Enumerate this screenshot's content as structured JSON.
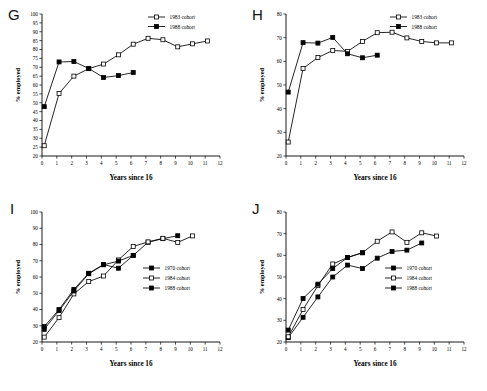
{
  "figure": {
    "axis_x_title": "Years since 16",
    "axis_y_title": "% employed"
  },
  "panels": [
    {
      "letter": "G",
      "chart_data": {
        "type": "line",
        "title": "G",
        "xlabel": "Years since 16",
        "ylabel": "% employed",
        "xlim": [
          0,
          12
        ],
        "ylim": [
          20,
          100
        ],
        "xticks": [
          0,
          1,
          2,
          3,
          4,
          5,
          6,
          7,
          8,
          9,
          10,
          11,
          12
        ],
        "yticks": [
          20,
          25,
          30,
          35,
          40,
          45,
          50,
          55,
          60,
          65,
          70,
          75,
          80,
          85,
          90,
          95,
          100
        ],
        "grid": false,
        "legend_position": "top-right",
        "series": [
          {
            "name": "1983 cohort",
            "marker": "open-square",
            "x": [
              0.15,
              1.15,
              2.15,
              3.15,
              4.15,
              5.15,
              6.15,
              7.15,
              8.15,
              9.15,
              10.15,
              11.15
            ],
            "values": [
              25.8,
              55.2,
              65.0,
              69.2,
              71.8,
              77.0,
              83.0,
              86.3,
              85.5,
              81.5,
              83.2,
              84.8
            ]
          },
          {
            "name": "1988 cohort",
            "marker": "filled-square",
            "x": [
              0.15,
              1.15,
              2.15,
              3.15,
              4.15,
              5.15,
              6.15
            ],
            "values": [
              47.8,
              73.0,
              73.2,
              69.3,
              64.2,
              65.3,
              67.0
            ]
          }
        ]
      }
    },
    {
      "letter": "H",
      "chart_data": {
        "type": "line",
        "title": "H",
        "xlabel": "Years since 16",
        "ylabel": "% employed",
        "xlim": [
          0,
          12
        ],
        "ylim": [
          20,
          80
        ],
        "xticks": [
          0,
          1,
          2,
          3,
          4,
          5,
          6,
          7,
          8,
          9,
          10,
          11,
          12
        ],
        "yticks": [
          20,
          30,
          40,
          50,
          60,
          70,
          80
        ],
        "grid": false,
        "legend_position": "top-right",
        "series": [
          {
            "name": "1983 cohort",
            "marker": "open-square",
            "x": [
              0.15,
              1.15,
              2.15,
              3.15,
              4.15,
              5.15,
              6.15,
              7.15,
              8.15,
              9.15,
              10.15,
              11.15
            ],
            "values": [
              25.9,
              57.0,
              61.6,
              64.6,
              64.2,
              68.4,
              72.1,
              72.3,
              69.9,
              68.4,
              67.8,
              67.8
            ]
          },
          {
            "name": "1988 cohort",
            "marker": "filled-square",
            "x": [
              0.15,
              1.15,
              2.15,
              3.15,
              4.15,
              5.15,
              6.15
            ],
            "values": [
              47.0,
              67.9,
              67.7,
              70.1,
              63.2,
              61.5,
              62.6
            ]
          }
        ]
      }
    },
    {
      "letter": "I",
      "chart_data": {
        "type": "line",
        "title": "I",
        "xlabel": "Years since 16",
        "ylabel": "% employed",
        "xlim": [
          0,
          12
        ],
        "ylim": [
          20,
          100
        ],
        "xticks": [
          0,
          1,
          2,
          3,
          4,
          5,
          6,
          7,
          8,
          9,
          10,
          11,
          12
        ],
        "yticks": [
          20,
          30,
          40,
          50,
          60,
          70,
          80,
          90,
          100
        ],
        "grid": false,
        "legend_position": "right",
        "series": [
          {
            "name": "1970 cohort",
            "marker": "filled-square",
            "x": [
              0.15,
              1.15,
              2.15,
              3.15,
              4.15,
              5.15,
              6.15,
              7.15,
              8.15,
              9.15
            ],
            "values": [
              29.5,
              40.0,
              52.4,
              62.3,
              67.7,
              65.4,
              73.3,
              81.4,
              83.6,
              85.4
            ]
          },
          {
            "name": "1984 cohort",
            "marker": "open-square",
            "x": [
              0.15,
              1.15,
              2.15,
              3.15,
              4.15,
              5.15,
              6.15,
              7.15,
              8.15,
              9.15,
              10.15
            ],
            "values": [
              23.0,
              35.0,
              49.6,
              57.2,
              60.6,
              70.5,
              78.8,
              81.6,
              83.8,
              81.3,
              85.3
            ]
          },
          {
            "name": "1988 cohort",
            "marker": "filled-square",
            "x": [
              0.15,
              1.15,
              2.15,
              3.15,
              4.15,
              5.15,
              6.15
            ],
            "values": [
              27.8,
              39.3,
              51.4,
              62.0,
              67.5,
              69.8,
              73.3
            ]
          }
        ]
      }
    },
    {
      "letter": "J",
      "chart_data": {
        "type": "line",
        "title": "J",
        "xlabel": "Years since 16",
        "ylabel": "% employed",
        "xlim": [
          0,
          12
        ],
        "ylim": [
          20,
          80
        ],
        "xticks": [
          0,
          1,
          2,
          3,
          4,
          5,
          6,
          7,
          8,
          9,
          10,
          11,
          12
        ],
        "yticks": [
          20,
          30,
          40,
          50,
          60,
          70,
          80
        ],
        "grid": false,
        "legend_position": "right",
        "series": [
          {
            "name": "1970 cohort",
            "marker": "filled-square",
            "x": [
              0.15,
              1.15,
              2.15,
              3.15,
              4.15,
              5.15,
              6.15,
              7.15,
              8.15,
              9.15
            ],
            "values": [
              22.0,
              31.4,
              40.8,
              50.0,
              55.5,
              53.9,
              58.7,
              61.8,
              62.4,
              65.7
            ]
          },
          {
            "name": "1984 cohort",
            "marker": "open-square",
            "x": [
              0.15,
              1.15,
              2.15,
              3.15,
              4.15,
              5.15,
              6.15,
              7.15,
              8.15,
              9.15,
              10.15
            ],
            "values": [
              22.4,
              35.0,
              46.0,
              56.0,
              59.0,
              61.2,
              66.5,
              70.8,
              66.0,
              70.4,
              68.9
            ]
          },
          {
            "name": "1988 cohort",
            "marker": "filled-square",
            "x": [
              0.15,
              1.15,
              2.15,
              3.15,
              4.15,
              5.15
            ],
            "values": [
              25.5,
              40.1,
              46.7,
              53.9,
              59.0,
              61.2
            ]
          }
        ]
      }
    }
  ]
}
